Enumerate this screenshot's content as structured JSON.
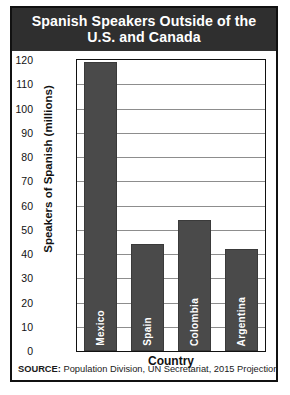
{
  "title": {
    "line1": "Spanish Speakers Outside of the",
    "line2": "U.S. and Canada"
  },
  "axes": {
    "ylabel": "Speakers of Spanish (millions)",
    "xlabel": "Country"
  },
  "source": {
    "label": "SOURCE:",
    "text": " Population Division, UN Secretariat, 2015 Projections"
  },
  "colors": {
    "bar": "#4a4a4a",
    "banner": "#2f2f2f",
    "border": "#111111",
    "gridline": "#8d8d8d",
    "bar_label": "#ffffff"
  },
  "chart_data": {
    "type": "bar",
    "title": "Spanish Speakers Outside of the U.S. and Canada",
    "xlabel": "Country",
    "ylabel": "Speakers of Spanish (millions)",
    "categories": [
      "Mexico",
      "Spain",
      "Colombia",
      "Argentina"
    ],
    "values": [
      119,
      44,
      54,
      42
    ],
    "ylim": [
      0,
      120
    ],
    "yticks": [
      0,
      10,
      20,
      30,
      40,
      50,
      60,
      70,
      80,
      90,
      100,
      110,
      120
    ],
    "ytick_labels": [
      "0",
      "10",
      "20",
      "30",
      "40",
      "50",
      "60",
      "70",
      "80",
      "90",
      "100",
      "110",
      "120"
    ],
    "grid": true,
    "legend": false,
    "source": "SOURCE: Population Division, UN Secretariat, 2015 Projections"
  }
}
